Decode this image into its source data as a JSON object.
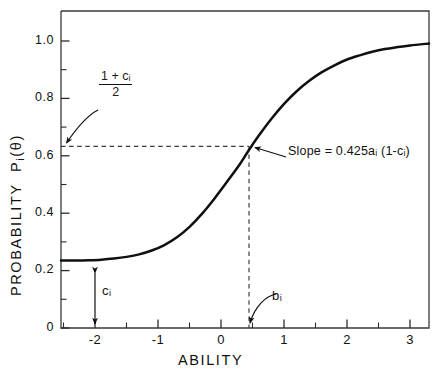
{
  "chart_data": {
    "type": "line",
    "title": "",
    "xlabel": "ABILITY",
    "ylabel": "PROBABILITY  Pᵢ(θ)",
    "ylabel_parts": {
      "word": "PROBABILITY",
      "symbol": "P",
      "sub": "i",
      "arg": "(θ)"
    },
    "xlim": [
      -2.54,
      3.3
    ],
    "ylim": [
      -0.045,
      1.105
    ],
    "grid": false,
    "legend": null,
    "xticks": [
      -2,
      -1,
      0,
      1,
      2,
      3
    ],
    "xtick_labels": [
      "-2",
      "-1",
      "0",
      "1",
      "2",
      "3"
    ],
    "xminorticks": [
      -2.5,
      -1.5,
      -0.5,
      0.5,
      1.5,
      2.5
    ],
    "yticks": [
      0,
      0.2,
      0.4,
      0.6,
      0.8,
      1.0
    ],
    "ytick_labels": [
      "0",
      "0.2",
      "0.4",
      "0.6",
      "0.8",
      "1.0"
    ],
    "yminorticks": [
      0.1,
      0.3,
      0.5,
      0.7,
      0.9
    ],
    "model": "three-parameter logistic item characteristic curve",
    "parameters": {
      "c_i": 0.2,
      "b_i": 0.44,
      "a_i": 1.0,
      "P_at_b": 0.6
    },
    "series": [
      {
        "name": "Item characteristic curve",
        "x": [
          -2.54,
          -2.3,
          -2.1,
          -1.9,
          -1.7,
          -1.5,
          -1.3,
          -1.1,
          -0.9,
          -0.7,
          -0.5,
          -0.3,
          -0.1,
          0.1,
          0.3,
          0.44,
          0.6,
          0.8,
          1.0,
          1.2,
          1.4,
          1.6,
          1.8,
          2.0,
          2.2,
          2.4,
          2.6,
          2.8,
          3.0,
          3.3
        ],
        "y": [
          0.2,
          0.2,
          0.201,
          0.203,
          0.207,
          0.213,
          0.222,
          0.236,
          0.256,
          0.284,
          0.322,
          0.37,
          0.426,
          0.487,
          0.55,
          0.6,
          0.653,
          0.714,
          0.768,
          0.814,
          0.852,
          0.883,
          0.908,
          0.929,
          0.944,
          0.957,
          0.967,
          0.974,
          0.98,
          0.987
        ]
      }
    ],
    "annotations": [
      {
        "name": "upper-asymptote-midpoint",
        "text_numerator": "1 + cᵢ",
        "text_denominator": "2",
        "kind": "fraction",
        "points_to": {
          "x": -2.5,
          "y": 0.65
        }
      },
      {
        "name": "slope",
        "text": "Slope = 0.425aᵢ (1-cᵢ)",
        "points_to": {
          "x": 0.44,
          "y": 0.6
        }
      },
      {
        "name": "difficulty",
        "text": "bᵢ",
        "points_to": {
          "x": 0.44,
          "y": 0.0
        }
      },
      {
        "name": "guessing",
        "text": "cᵢ",
        "kind": "double-arrow",
        "from": {
          "x": -2.3,
          "y": 0.0
        },
        "to": {
          "x": -2.3,
          "y": 0.2
        }
      }
    ],
    "guides": [
      {
        "name": "horizontal-dashed-guide",
        "orientation": "horizontal",
        "value": 0.65,
        "style": "dashed"
      },
      {
        "name": "vertical-dashed-guide",
        "orientation": "vertical",
        "value": 0.44,
        "style": "dashed"
      }
    ],
    "colors": {
      "curve": "#101010",
      "axis": "#2b2b2b",
      "guide": "#3a3a3a",
      "background": "#ffffff"
    }
  }
}
